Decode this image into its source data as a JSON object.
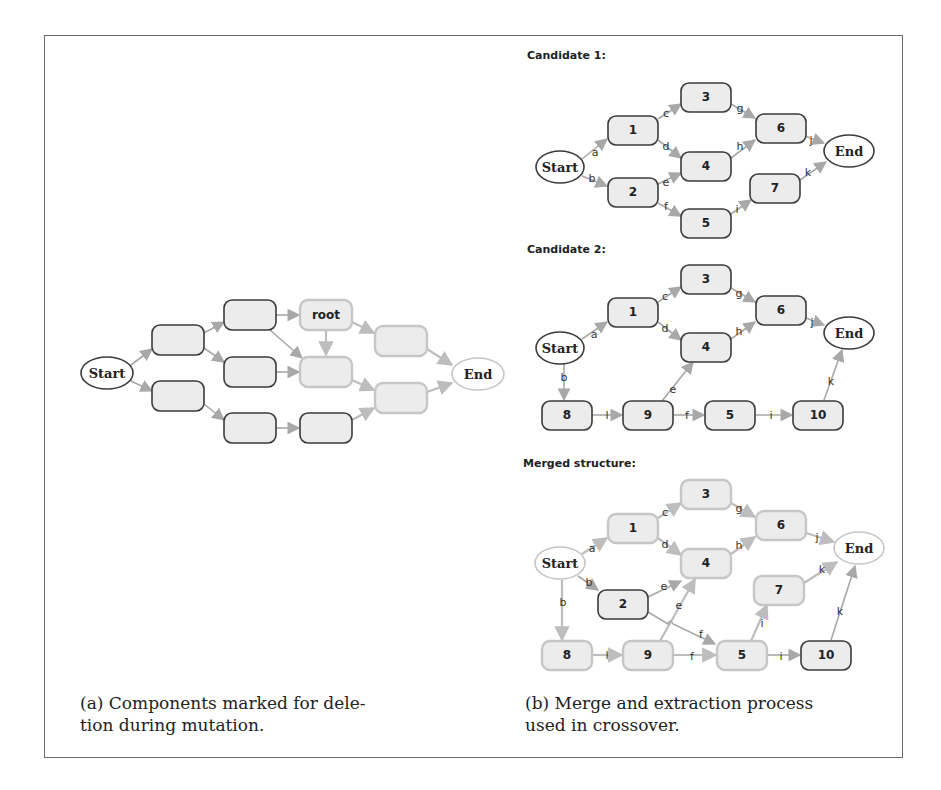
{
  "figure": {
    "panel_a": {
      "caption_line1": "(a) Components marked for dele-",
      "caption_line2": "tion during mutation.",
      "start_label": "Start",
      "end_label": "End",
      "root_label": "root"
    },
    "panel_b": {
      "caption_line1": "(b) Merge and extraction process",
      "caption_line2": "used in crossover.",
      "candidate1": {
        "title": "Candidate 1:",
        "start_label": "Start",
        "end_label": "End",
        "nodes": [
          "1",
          "2",
          "3",
          "4",
          "5",
          "6",
          "7"
        ],
        "edges": [
          "a",
          "b",
          "c",
          "d",
          "e",
          "f",
          "g",
          "h",
          "i",
          "j",
          "k"
        ]
      },
      "candidate2": {
        "title": "Candidate 2:",
        "start_label": "Start",
        "end_label": "End",
        "nodes": [
          "1",
          "3",
          "4",
          "6",
          "8",
          "9",
          "5",
          "10"
        ],
        "edges": [
          "a",
          "b",
          "c",
          "d",
          "e",
          "f",
          "g",
          "h",
          "i",
          "j",
          "k",
          "l"
        ]
      },
      "merged": {
        "title": "Merged structure:",
        "start_label": "Start",
        "end_label": "End",
        "nodes": [
          "1",
          "2",
          "3",
          "4",
          "5",
          "6",
          "7",
          "8",
          "9",
          "10"
        ],
        "edges": [
          "a",
          "b",
          "b",
          "c",
          "d",
          "e",
          "e",
          "f",
          "f",
          "g",
          "h",
          "i",
          "i",
          "j",
          "k",
          "k",
          "l"
        ]
      }
    }
  }
}
